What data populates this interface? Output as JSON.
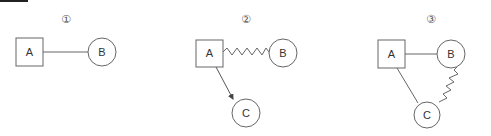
{
  "diagrams": [
    {
      "label": "①",
      "nodes": {
        "A": "A",
        "B": "B"
      },
      "edges": [
        {
          "from": "A",
          "to": "B",
          "style": "straight"
        }
      ]
    },
    {
      "label": "②",
      "nodes": {
        "A": "A",
        "B": "B",
        "C": "C"
      },
      "edges": [
        {
          "from": "A",
          "to": "B",
          "style": "zigzag"
        },
        {
          "from": "A",
          "to": "C",
          "style": "arrow"
        }
      ]
    },
    {
      "label": "③",
      "nodes": {
        "A": "A",
        "B": "B",
        "C": "C"
      },
      "edges": [
        {
          "from": "A",
          "to": "B",
          "style": "straight"
        },
        {
          "from": "A",
          "to": "C",
          "style": "straight"
        },
        {
          "from": "B",
          "to": "C",
          "style": "zigzag"
        }
      ]
    }
  ],
  "colors": {
    "stroke": "#555555",
    "text": "#333333"
  }
}
